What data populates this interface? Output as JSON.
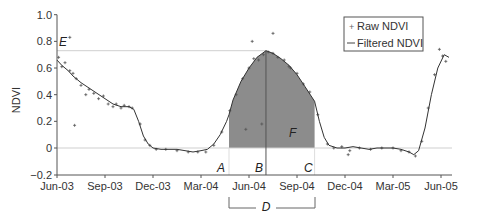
{
  "chart_data": {
    "type": "line",
    "title": "",
    "xlabel": "",
    "ylabel": "NDVI",
    "ylim": [
      -0.2,
      1.0
    ],
    "yticks": [
      -0.2,
      0,
      0.2,
      0.4,
      0.6,
      0.8,
      1.0
    ],
    "ytick_labels": [
      "−0.2",
      "0",
      "0.2",
      "0.4",
      "0.6",
      "0.8",
      "1.0"
    ],
    "xticks": [
      "Jun-03",
      "Sep-03",
      "Dec-03",
      "Mar-04",
      "Jun-04",
      "Sep-04",
      "Dec-04",
      "Mar-05",
      "Jun-05"
    ],
    "xtick_month_index": [
      0,
      3,
      6,
      9,
      12,
      15,
      18,
      21,
      24
    ],
    "grid": false,
    "legend": {
      "position": "upper-right",
      "entries": [
        {
          "label": "Raw NDVI",
          "marker": "+"
        },
        {
          "label": "Filtered NDVI",
          "marker": "line"
        }
      ]
    },
    "series": [
      {
        "name": "Filtered NDVI",
        "x_month_index": [
          0,
          0.3,
          0.7,
          1,
          1.5,
          2,
          2.5,
          3,
          3.5,
          4,
          4.5,
          4.8,
          5.1,
          5.4,
          5.7,
          6,
          6.5,
          7,
          7.5,
          8,
          8.5,
          9,
          9.4,
          9.8,
          10.2,
          10.6,
          10.75,
          11,
          11.5,
          12,
          12.5,
          13.06,
          13.5,
          14,
          14.5,
          15,
          15.5,
          16.1,
          16.4,
          16.7,
          17,
          17.5,
          18,
          18.5,
          19,
          19.5,
          20,
          20.5,
          21,
          21.5,
          22,
          22.3,
          22.6,
          23,
          23.4,
          23.8,
          24.2,
          24.5
        ],
        "values": [
          0.66,
          0.62,
          0.58,
          0.54,
          0.49,
          0.45,
          0.41,
          0.37,
          0.33,
          0.31,
          0.31,
          0.29,
          0.2,
          0.09,
          0.03,
          0.0,
          -0.01,
          -0.01,
          -0.01,
          -0.02,
          -0.03,
          -0.02,
          -0.01,
          0.03,
          0.1,
          0.2,
          0.25,
          0.36,
          0.5,
          0.6,
          0.68,
          0.73,
          0.71,
          0.67,
          0.62,
          0.55,
          0.46,
          0.35,
          0.2,
          0.08,
          0.02,
          0.0,
          0.0,
          0.01,
          0.0,
          -0.01,
          0.0,
          0.0,
          0.0,
          -0.01,
          -0.03,
          -0.05,
          -0.02,
          0.15,
          0.4,
          0.6,
          0.7,
          0.68
        ]
      },
      {
        "name": "Raw NDVI",
        "x_month_index": [
          0.1,
          0.3,
          0.5,
          0.8,
          1.0,
          1.2,
          1.5,
          1.8,
          2.0,
          2.3,
          2.6,
          2.9,
          3.2,
          3.5,
          3.7,
          4.0,
          4.2,
          4.5,
          4.7,
          5.2,
          5.5,
          5.8,
          6.2,
          6.8,
          7.5,
          8.2,
          8.8,
          9.3,
          9.8,
          10.3,
          10.8,
          11.2,
          11.6,
          12.0,
          12.3,
          12.6,
          12.9,
          13.2,
          13.5,
          13.8,
          14.2,
          14.6,
          15.0,
          15.4,
          15.8,
          16.3,
          16.9,
          17.3,
          17.8,
          18.3,
          18.9,
          19.6,
          20.3,
          21.0,
          21.5,
          22.0,
          22.4,
          22.8,
          23.2,
          23.6,
          23.9,
          24.1,
          24.3,
          0.8,
          1.1,
          11.8,
          13.5,
          14.5,
          12.8,
          12.2,
          18.2
        ],
        "values": [
          0.68,
          0.61,
          0.64,
          0.58,
          0.56,
          0.52,
          0.47,
          0.4,
          0.44,
          0.41,
          0.37,
          0.39,
          0.33,
          0.31,
          0.33,
          0.3,
          0.32,
          0.31,
          0.3,
          0.18,
          0.06,
          0.02,
          -0.01,
          -0.01,
          -0.02,
          -0.03,
          -0.03,
          -0.03,
          0.02,
          0.12,
          0.28,
          0.4,
          0.52,
          0.6,
          0.67,
          0.66,
          0.7,
          0.72,
          0.71,
          0.68,
          0.66,
          0.6,
          0.56,
          0.48,
          0.42,
          0.25,
          0.03,
          0.0,
          0.01,
          -0.02,
          0.0,
          -0.01,
          0.0,
          0.0,
          -0.02,
          -0.03,
          -0.06,
          0.05,
          0.3,
          0.55,
          0.74,
          0.69,
          0.65,
          0.83,
          0.17,
          0.14,
          0.86,
          0.61,
          0.18,
          0.8,
          -0.05
        ]
      }
    ],
    "annotations": [
      {
        "label": "A",
        "month_index": 10.75,
        "description": "start of season"
      },
      {
        "label": "B",
        "month_index": 13.06,
        "description": "peak"
      },
      {
        "label": "C",
        "month_index": 16.1,
        "description": "end of season"
      },
      {
        "label": "D",
        "description": "length of season (A to C)"
      },
      {
        "label": "E",
        "value": 0.73,
        "description": "maximum NDVI"
      },
      {
        "label": "F",
        "description": "integrated NDVI (shaded area)"
      }
    ]
  },
  "axis": {
    "y_title": "NDVI"
  },
  "legend": {
    "raw_label": "Raw NDVI",
    "filtered_label": "Filtered NDVI",
    "raw_marker": "+",
    "filtered_marker": "—"
  },
  "labels": {
    "A": "A",
    "B": "B",
    "C": "C",
    "D": "D",
    "E": "E",
    "F": "F"
  },
  "colors": {
    "shade": "#8c8c8c",
    "line": "#333333",
    "raw": "#555555",
    "axis": "#555555",
    "ref": "#cfcfcf"
  }
}
